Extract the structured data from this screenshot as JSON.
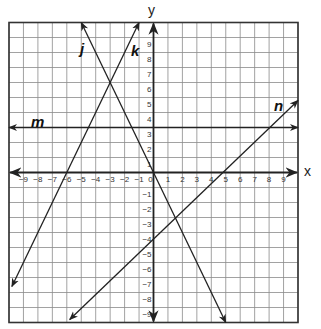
{
  "chart_data": {
    "type": "line",
    "title": "",
    "xlabel": "x",
    "ylabel": "y",
    "xlim": [
      -10,
      10
    ],
    "ylim": [
      -10,
      10
    ],
    "grid": true,
    "x_ticks": [
      -9,
      -8,
      -7,
      -6,
      -5,
      -4,
      -3,
      -2,
      -1,
      0,
      1,
      2,
      3,
      4,
      5,
      6,
      7,
      8,
      9
    ],
    "y_ticks": [
      -9,
      -8,
      -7,
      -6,
      -5,
      -4,
      -3,
      -2,
      -1,
      1,
      2,
      3,
      4,
      5,
      6,
      7,
      8,
      9
    ],
    "series": [
      {
        "name": "j",
        "equation": "y = -2x",
        "x": [
          -5,
          5
        ],
        "y": [
          10,
          -10
        ]
      },
      {
        "name": "k",
        "equation": "y = 2x + 12",
        "x": [
          -9.8,
          -1
        ],
        "y": [
          -7.6,
          10
        ]
      },
      {
        "name": "m",
        "equation": "y = 3",
        "x": [
          -10,
          10
        ],
        "y": [
          3,
          3
        ]
      },
      {
        "name": "n",
        "equation": "y ≈ 0.92x - 4.4",
        "x": [
          -5.8,
          10
        ],
        "y": [
          -9.8,
          4.8
        ]
      }
    ],
    "intersections": [
      {
        "lines": [
          "j",
          "k"
        ],
        "point": [
          -3,
          6
        ]
      },
      {
        "lines": [
          "j",
          "n"
        ],
        "point": [
          1.5,
          -3
        ]
      },
      {
        "lines": [
          "m",
          "n"
        ],
        "point": [
          8,
          3
        ]
      }
    ]
  },
  "labels": {
    "x_axis": "x",
    "y_axis": "y",
    "j": "j",
    "k": "k",
    "m": "m",
    "n": "n"
  }
}
